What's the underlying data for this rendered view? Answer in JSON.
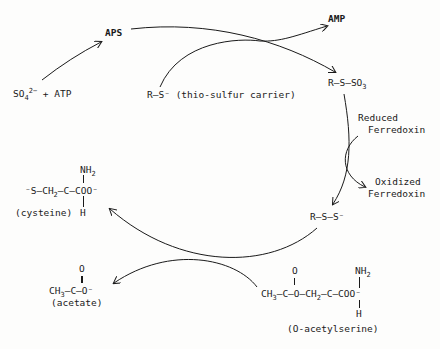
{
  "diagram": {
    "nodes": {
      "sulfate_atp": {
        "main": "SO",
        "sub": "4",
        "sup": "2−",
        "rest": " + ATP"
      },
      "aps": "APS",
      "amp": "AMP",
      "thio_carrier": {
        "formula": "R—S⁻",
        "label": "(thio-sulfur carrier)"
      },
      "r_s_so3": {
        "formula": "R—S—SO",
        "sub": "3"
      },
      "reduced_ferredoxin": {
        "line1": "Reduced",
        "line2": "Ferredoxin"
      },
      "oxidized_ferredoxin": {
        "line1": "Oxidized",
        "line2": "Ferredoxin"
      },
      "r_s_s": "R—S—S⁻",
      "cysteine": {
        "top": "NH",
        "top_sub": "2",
        "left": "⁻S—CH",
        "left_sub": "2",
        "middle": "—C—COO⁻",
        "bottom": "H",
        "label": "(cysteine)"
      },
      "acetate": {
        "top": "O",
        "formula_a": "CH",
        "formula_sub": "3",
        "formula_b": "—C—O⁻",
        "label": "(acetate)"
      },
      "o_acetylserine": {
        "top_o": "O",
        "top_nh": "NH",
        "top_nh_sub": "2",
        "formula_a": "CH",
        "formula_sub1": "3",
        "formula_b": "—C—O—CH",
        "formula_sub2": "2",
        "formula_c": "—C—COO⁻",
        "bottom": "H",
        "label": "(O-acetylserine)"
      }
    },
    "edges": [
      {
        "from": "sulfate_atp",
        "to": "aps"
      },
      {
        "from": "aps",
        "to": "r_s_so3"
      },
      {
        "from": "thio_carrier",
        "to": "amp"
      },
      {
        "from": "r_s_so3",
        "to": "r_s_s"
      },
      {
        "from": "reduced_ferredoxin",
        "to": "oxidized_ferredoxin"
      },
      {
        "from": "r_s_s",
        "to": "cysteine"
      },
      {
        "from": "o_acetylserine",
        "to": "acetate"
      }
    ]
  }
}
